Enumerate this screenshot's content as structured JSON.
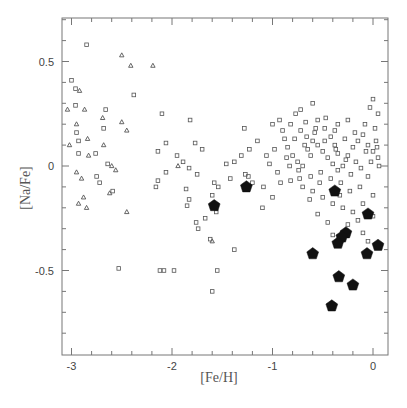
{
  "chart_data": {
    "type": "scatter",
    "title": "",
    "xlabel": "[Fe/H]",
    "ylabel": "[Na/Fe]",
    "xlim": [
      -3.1,
      0.15
    ],
    "ylim": [
      -0.9,
      0.71
    ],
    "x_ticks": [
      -3,
      -2,
      -1,
      0
    ],
    "x_tick_labels": [
      "-3",
      "-2",
      "-1",
      "0"
    ],
    "y_ticks": [
      0.5,
      0,
      -0.5
    ],
    "y_tick_labels": [
      "0.5",
      "0",
      "-0.5"
    ],
    "grid": false,
    "legend": null,
    "series": [
      {
        "name": "open-squares",
        "marker": "square-open",
        "color": "#555555",
        "points": [
          [
            -2.85,
            0.58
          ],
          [
            -3.0,
            0.41
          ],
          [
            -2.96,
            0.37
          ],
          [
            -2.96,
            0.29
          ],
          [
            -2.66,
            0.27
          ],
          [
            -2.68,
            0.18
          ],
          [
            -2.95,
            0.16
          ],
          [
            -2.93,
            0.12
          ],
          [
            -2.76,
            0.06
          ],
          [
            -2.93,
            0.06
          ],
          [
            -2.64,
            0.01
          ],
          [
            -2.75,
            -0.05
          ],
          [
            -2.72,
            -0.08
          ],
          [
            -2.59,
            -0.12
          ],
          [
            -2.38,
            0.34
          ],
          [
            -2.1,
            0.25
          ],
          [
            -2.06,
            0.11
          ],
          [
            -2.14,
            0.07
          ],
          [
            -2.06,
            -0.03
          ],
          [
            -2.14,
            -0.07
          ],
          [
            -2.16,
            -0.1
          ],
          [
            -1.82,
            0.22
          ],
          [
            -1.77,
            0.11
          ],
          [
            -1.95,
            0.05
          ],
          [
            -1.89,
            0.02
          ],
          [
            -1.7,
            0.08
          ],
          [
            -1.83,
            -0.01
          ],
          [
            -1.75,
            -0.04
          ],
          [
            -1.86,
            -0.11
          ],
          [
            -1.83,
            -0.16
          ],
          [
            -1.85,
            -0.19
          ],
          [
            -1.76,
            -0.27
          ],
          [
            -1.67,
            -0.25
          ],
          [
            -1.74,
            -0.3
          ],
          [
            -1.6,
            -0.14
          ],
          [
            -1.58,
            -0.08
          ],
          [
            -1.54,
            -0.1
          ],
          [
            -1.46,
            0.01
          ],
          [
            -1.38,
            0.02
          ],
          [
            -1.42,
            -0.06
          ],
          [
            -1.31,
            0.05
          ],
          [
            -1.27,
            -0.04
          ],
          [
            -1.23,
            0.08
          ],
          [
            -1.56,
            -0.22
          ],
          [
            -1.62,
            -0.35
          ],
          [
            -1.55,
            -0.5
          ],
          [
            -1.6,
            -0.6
          ],
          [
            -1.38,
            -0.4
          ],
          [
            -1.98,
            -0.5
          ],
          [
            -2.08,
            -0.5
          ],
          [
            -2.12,
            -0.5
          ],
          [
            -2.53,
            -0.49
          ],
          [
            -1.24,
            -0.05
          ],
          [
            -1.2,
            -0.08
          ],
          [
            -1.09,
            -0.1
          ],
          [
            -1.0,
            -0.15
          ],
          [
            -1.1,
            -0.2
          ],
          [
            -1.03,
            0.01
          ],
          [
            -1.15,
            0.12
          ],
          [
            -1.28,
            0.18
          ],
          [
            -1.0,
            0.2
          ],
          [
            -0.93,
            0.22
          ],
          [
            -0.82,
            0.2
          ],
          [
            -0.77,
            0.25
          ],
          [
            -0.72,
            0.17
          ],
          [
            -0.66,
            0.14
          ],
          [
            -0.6,
            0.3
          ],
          [
            -0.55,
            0.22
          ],
          [
            -0.48,
            0.18
          ],
          [
            -0.42,
            0.14
          ],
          [
            -0.38,
            0.1
          ],
          [
            -0.35,
            0.06
          ],
          [
            -0.88,
            0.13
          ],
          [
            -0.85,
            0.09
          ],
          [
            -0.8,
            0.05
          ],
          [
            -0.75,
            0.02
          ],
          [
            -0.7,
            0.0
          ],
          [
            -0.65,
            0.08
          ],
          [
            -0.6,
            0.12
          ],
          [
            -0.55,
            0.1
          ],
          [
            -0.5,
            0.07
          ],
          [
            -0.45,
            0.04
          ],
          [
            -0.4,
            0.01
          ],
          [
            -0.35,
            -0.02
          ],
          [
            -0.3,
            0.0
          ],
          [
            -0.25,
            0.05
          ],
          [
            -0.2,
            0.09
          ],
          [
            -0.15,
            0.12
          ],
          [
            -0.1,
            0.15
          ],
          [
            -0.05,
            0.1
          ],
          [
            0.0,
            0.07
          ],
          [
            0.05,
            0.04
          ],
          [
            -0.9,
            0.17
          ],
          [
            -0.78,
            0.13
          ],
          [
            -0.68,
            0.1
          ],
          [
            -0.58,
            0.16
          ],
          [
            -0.48,
            0.12
          ],
          [
            -0.38,
            0.17
          ],
          [
            -0.28,
            0.13
          ],
          [
            -0.18,
            0.16
          ],
          [
            -0.08,
            0.2
          ],
          [
            0.02,
            0.18
          ],
          [
            -0.86,
            0.04
          ],
          [
            -0.74,
            -0.02
          ],
          [
            -0.62,
            -0.05
          ],
          [
            -0.52,
            -0.03
          ],
          [
            -0.42,
            -0.06
          ],
          [
            -0.32,
            -0.08
          ],
          [
            -0.22,
            -0.04
          ],
          [
            -0.12,
            -0.01
          ],
          [
            -0.02,
            0.02
          ],
          [
            0.06,
            0.0
          ],
          [
            -0.7,
            -0.1
          ],
          [
            -0.6,
            -0.12
          ],
          [
            -0.5,
            -0.15
          ],
          [
            -0.4,
            -0.18
          ],
          [
            -0.3,
            -0.2
          ],
          [
            -0.2,
            -0.22
          ],
          [
            -0.1,
            -0.18
          ],
          [
            0.0,
            -0.14
          ],
          [
            -0.15,
            -0.26
          ],
          [
            -0.25,
            -0.28
          ],
          [
            -0.45,
            -0.27
          ],
          [
            -0.55,
            -0.23
          ],
          [
            -0.05,
            -0.05
          ],
          [
            0.03,
            0.12
          ],
          [
            -0.03,
            0.28
          ],
          [
            0.0,
            0.32
          ],
          [
            0.05,
            0.25
          ],
          [
            -0.35,
            0.2
          ],
          [
            -0.25,
            0.22
          ],
          [
            -0.62,
            0.05
          ],
          [
            -0.82,
            -0.07
          ],
          [
            -0.95,
            -0.03
          ],
          [
            -0.98,
            0.08
          ],
          [
            -1.06,
            0.05
          ],
          [
            -0.72,
            0.27
          ],
          [
            -0.67,
            0.21
          ],
          [
            -0.57,
            0.18
          ],
          [
            -0.47,
            0.23
          ],
          [
            -0.37,
            0.08
          ],
          [
            -0.27,
            0.03
          ],
          [
            -0.17,
            0.02
          ],
          [
            -0.07,
            0.07
          ],
          [
            0.04,
            0.09
          ],
          [
            -0.13,
            -0.1
          ],
          [
            -0.23,
            -0.12
          ],
          [
            -0.33,
            -0.14
          ],
          [
            -0.53,
            -0.08
          ],
          [
            -0.63,
            -0.16
          ],
          [
            -0.73,
            -0.06
          ],
          [
            -0.83,
            0.0
          ],
          [
            -0.92,
            -0.08
          ],
          [
            -0.1,
            -0.32
          ],
          [
            -0.05,
            -0.36
          ],
          [
            0.0,
            -0.24
          ],
          [
            -0.4,
            -0.33
          ]
        ]
      },
      {
        "name": "open-triangles",
        "marker": "triangle-open",
        "color": "#555555",
        "points": [
          [
            -2.5,
            0.53
          ],
          [
            -2.41,
            0.48
          ],
          [
            -2.19,
            0.48
          ],
          [
            -2.92,
            0.36
          ],
          [
            -3.04,
            0.27
          ],
          [
            -2.87,
            0.27
          ],
          [
            -2.69,
            0.23
          ],
          [
            -2.5,
            0.21
          ],
          [
            -2.45,
            0.17
          ],
          [
            -2.84,
            0.13
          ],
          [
            -2.95,
            0.2
          ],
          [
            -2.83,
            0.05
          ],
          [
            -3.02,
            0.1
          ],
          [
            -2.56,
            -0.02
          ],
          [
            -2.68,
            0.1
          ],
          [
            -2.6,
            0.0
          ],
          [
            -2.95,
            -0.03
          ],
          [
            -2.9,
            -0.06
          ],
          [
            -2.62,
            -0.13
          ],
          [
            -2.88,
            -0.15
          ],
          [
            -2.85,
            -0.2
          ],
          [
            -2.45,
            -0.22
          ],
          [
            -2.93,
            -0.18
          ],
          [
            -1.94,
            0.0
          ],
          [
            -1.6,
            -0.36
          ]
        ]
      },
      {
        "name": "filled-pentagons",
        "marker": "pentagon-filled",
        "color": "#111111",
        "points": [
          [
            -1.58,
            -0.19
          ],
          [
            -1.26,
            -0.1
          ],
          [
            -0.38,
            -0.12
          ],
          [
            -0.05,
            -0.23
          ],
          [
            -0.27,
            -0.32
          ],
          [
            -0.31,
            -0.34
          ],
          [
            -0.35,
            -0.37
          ],
          [
            0.05,
            -0.38
          ],
          [
            -0.6,
            -0.42
          ],
          [
            -0.06,
            -0.42
          ],
          [
            -0.34,
            -0.53
          ],
          [
            -0.2,
            -0.57
          ],
          [
            -0.41,
            -0.67
          ]
        ]
      }
    ]
  }
}
